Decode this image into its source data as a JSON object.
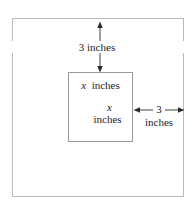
{
  "figure": {
    "kind": "geometry-diagram",
    "colors": {
      "background": "#ffffff",
      "outer_border": "#b9b9bb",
      "inner_border": "#9a9a9c",
      "ink": "#1c1c1c",
      "arrow": "#2b2b2b"
    },
    "outer_square": {
      "name": "outer-square",
      "x": 12,
      "y": 18,
      "width": 172,
      "height": 179
    },
    "inner_square": {
      "name": "inner-square",
      "x": 68,
      "y": 72,
      "width": 65,
      "height": 70
    },
    "labels": {
      "top_dimension": "3 inches",
      "inner_top": {
        "variable": "x",
        "unit": "inches"
      },
      "inner_middle": {
        "variable": "x",
        "unit": "inches"
      },
      "right_dimension": {
        "value": "3",
        "unit": "inches"
      }
    },
    "dimension_lines": [
      {
        "name": "top-margin-dimension",
        "orientation": "vertical",
        "x": 100,
        "from_y": 22,
        "to_y": 72,
        "arrowheads": "both",
        "label": "3 inches"
      },
      {
        "name": "right-margin-dimension",
        "orientation": "horizontal",
        "y": 110,
        "from_x": 134,
        "to_x": 184,
        "arrowheads": "both",
        "label": "3 inches"
      }
    ]
  }
}
